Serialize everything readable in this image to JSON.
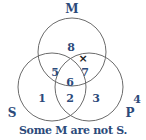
{
  "diagram": {
    "type": "venn",
    "sets": [
      {
        "name": "M",
        "label": "M"
      },
      {
        "name": "S",
        "label": "S"
      },
      {
        "name": "P",
        "label": "P"
      }
    ],
    "regions": {
      "r1": "1",
      "r2": "2",
      "r3": "3",
      "r4": "4",
      "r5": "5",
      "r6": "6",
      "r7": "7",
      "r8": "8"
    },
    "marker": {
      "symbol": "×",
      "location": "on P boundary within M (region 7/8 border)"
    },
    "caption": "Some M are not S.",
    "colors": {
      "text": "#2c4a7a",
      "stroke": "#6b6b6b"
    }
  }
}
